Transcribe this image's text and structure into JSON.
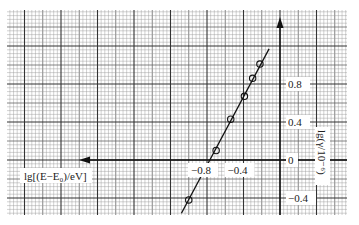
{
  "chart_data": {
    "type": "scatter",
    "title": "",
    "xlabel": "lg[(E−E₀)/eV]",
    "ylabel": "lg(γ/10⁻⁶)",
    "x_ticks": [
      -0.8,
      -0.4,
      0
    ],
    "x_tick_labels": [
      "−0.8",
      "−0.4"
    ],
    "y_ticks": [
      0.8,
      0.4,
      0,
      -0.4
    ],
    "y_tick_labels": [
      "0.8",
      "0.4",
      "0",
      "−0.4"
    ],
    "xlim": [
      -1.18,
      0.6
    ],
    "ylim": [
      -0.55,
      1.55
    ],
    "grid": true,
    "legend": null,
    "series": [
      {
        "name": "measured points",
        "marker": "circle",
        "x": [
          -1.0,
          -0.7,
          -0.54,
          -0.39,
          -0.3,
          -0.22
        ],
        "y": [
          -0.42,
          0.1,
          0.43,
          0.67,
          0.86,
          1.01
        ]
      },
      {
        "name": "fit line",
        "style": "solid",
        "x": [
          -1.08,
          -0.12
        ],
        "y": [
          -0.56,
          1.17
        ]
      }
    ],
    "colors": {
      "grid_minor": "#9a9a9a",
      "grid_major": "#333333",
      "ink": "#111111",
      "paper": "#ffffff"
    }
  }
}
